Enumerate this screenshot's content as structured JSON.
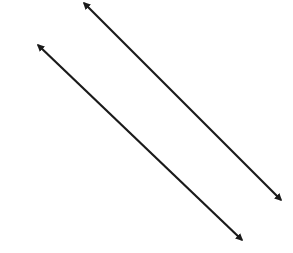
{
  "diagram": {
    "background": "#ffffff",
    "stroke_color": "#1a1a1a",
    "stroke_width": 2.2,
    "lines": [
      {
        "name": "line-upper",
        "x1": 84,
        "y1": 3,
        "x2": 281,
        "y2": 200
      },
      {
        "name": "line-lower",
        "x1": 38,
        "y1": 45,
        "x2": 242,
        "y2": 240
      }
    ]
  }
}
